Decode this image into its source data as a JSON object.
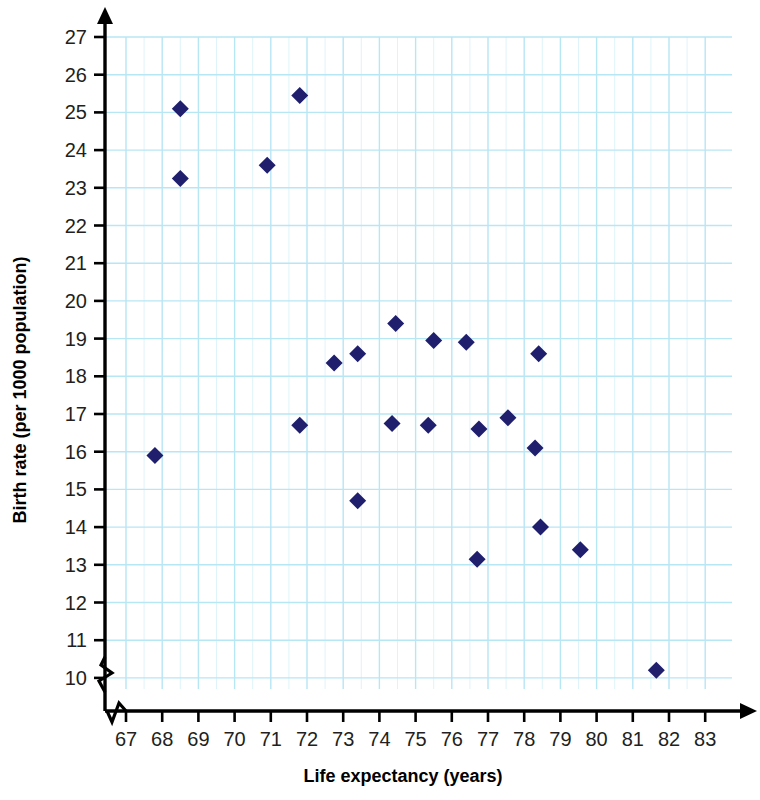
{
  "chart_data": {
    "type": "scatter",
    "title": "",
    "xlabel": "Life expectancy (years)",
    "ylabel": "Birth rate (per 1000 population)",
    "xlim": [
      66.5,
      83.5
    ],
    "ylim": [
      9.6,
      27.3
    ],
    "xticks": [
      67,
      68,
      69,
      70,
      71,
      72,
      73,
      74,
      75,
      76,
      77,
      78,
      79,
      80,
      81,
      82,
      83
    ],
    "yticks": [
      10,
      11,
      12,
      13,
      14,
      15,
      16,
      17,
      18,
      19,
      20,
      21,
      22,
      23,
      24,
      25,
      26,
      27
    ],
    "xtick_labels": [
      "67",
      "68",
      "69",
      "70",
      "71",
      "72",
      "73",
      "74",
      "75",
      "76",
      "77",
      "78",
      "79",
      "80",
      "81",
      "82",
      "83"
    ],
    "ytick_labels": [
      "10",
      "11",
      "12",
      "13",
      "14",
      "15",
      "16",
      "17",
      "18",
      "19",
      "20",
      "21",
      "22",
      "23",
      "24",
      "25",
      "26",
      "27"
    ],
    "grid": true,
    "grid_color": "#b7e6f5",
    "axis_color": "#000000",
    "marker": "diamond",
    "marker_color": "#1f1f6e",
    "legend": "none",
    "axis_break_x": true,
    "axis_break_y": true,
    "points": [
      {
        "x": 67.8,
        "y": 15.9
      },
      {
        "x": 68.5,
        "y": 25.1
      },
      {
        "x": 68.5,
        "y": 23.25
      },
      {
        "x": 70.9,
        "y": 23.6
      },
      {
        "x": 71.8,
        "y": 25.45
      },
      {
        "x": 71.8,
        "y": 16.7
      },
      {
        "x": 72.75,
        "y": 18.35
      },
      {
        "x": 73.4,
        "y": 18.6
      },
      {
        "x": 73.4,
        "y": 14.7
      },
      {
        "x": 74.35,
        "y": 16.75
      },
      {
        "x": 74.45,
        "y": 19.4
      },
      {
        "x": 75.35,
        "y": 16.7
      },
      {
        "x": 75.5,
        "y": 18.95
      },
      {
        "x": 76.4,
        "y": 18.9
      },
      {
        "x": 76.75,
        "y": 16.6
      },
      {
        "x": 76.7,
        "y": 13.15
      },
      {
        "x": 77.55,
        "y": 16.9
      },
      {
        "x": 78.3,
        "y": 16.1
      },
      {
        "x": 78.4,
        "y": 18.6
      },
      {
        "x": 78.45,
        "y": 14.0
      },
      {
        "x": 79.55,
        "y": 13.4
      },
      {
        "x": 81.65,
        "y": 10.2
      }
    ]
  }
}
